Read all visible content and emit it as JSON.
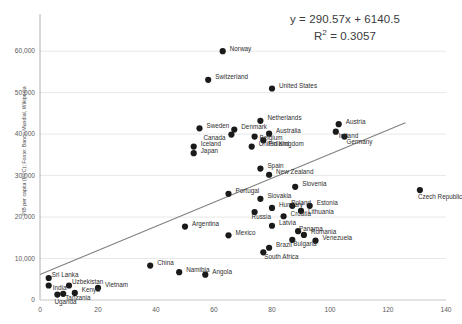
{
  "chart_data": {
    "type": "scatter",
    "title": "",
    "xlabel": "",
    "ylabel": "PIB per capita (PPC); Fonte: Banco Mundial, Wikipedia",
    "xlim": [
      0,
      140
    ],
    "ylim": [
      0,
      68000
    ],
    "xticks": [
      0,
      20,
      40,
      60,
      80,
      100,
      120,
      140
    ],
    "xtick_labels": [
      "0",
      "20",
      "40",
      "60",
      "80",
      "100",
      "120",
      "140"
    ],
    "yticks": [
      0,
      10000,
      20000,
      30000,
      40000,
      50000,
      60000
    ],
    "ytick_labels": [
      "0",
      "10,000",
      "20,000",
      "30,000",
      "40,000",
      "50,000",
      "60,000"
    ],
    "grid": "horizontal",
    "legend": "none",
    "marker_color": "#1a1a1a",
    "trendline_color": "#808080",
    "gridline_color": "#e8e8e8",
    "annotations": {
      "equation": "y = 290.57x + 6140.5",
      "r_squared_prefix": "R",
      "r_squared_sup": "2",
      "r_squared_value": " = 0.3057"
    },
    "trendline": {
      "slope": 290.57,
      "intercept": 6140.5,
      "x_start": 0,
      "x_end": 126
    },
    "points": [
      {
        "label": "Norway",
        "x": 63,
        "y": 60000,
        "lx": 7,
        "ly": -3
      },
      {
        "label": "Switzerland",
        "x": 58,
        "y": 53100,
        "lx": 7,
        "ly": -3
      },
      {
        "label": "United States",
        "x": 80,
        "y": 51000,
        "lx": 7,
        "ly": -3
      },
      {
        "label": "Netherlands",
        "x": 76,
        "y": 43200,
        "lx": 7,
        "ly": -3
      },
      {
        "label": "Austria",
        "x": 103,
        "y": 42400,
        "lx": 7,
        "ly": -3
      },
      {
        "label": "Sweden",
        "x": 55,
        "y": 41400,
        "lx": 7,
        "ly": -3
      },
      {
        "label": "Denmark",
        "x": 67,
        "y": 41100,
        "lx": 7,
        "ly": -3
      },
      {
        "label": "Ireland",
        "x": 102,
        "y": 40600,
        "lx": 3,
        "ly": 3.5
      },
      {
        "label": "Australia",
        "x": 79,
        "y": 40100,
        "lx": 7,
        "ly": -3
      },
      {
        "label": "Canada",
        "x": 66,
        "y": 39900,
        "lx": -28,
        "ly": 3
      },
      {
        "label": "Germany",
        "x": 105,
        "y": 39400,
        "lx": 2,
        "ly": 4.5
      },
      {
        "label": "Belgium",
        "x": 74,
        "y": 39400,
        "lx": 5,
        "ly": 1
      },
      {
        "label": "Finland",
        "x": 77,
        "y": 38500,
        "lx": 5,
        "ly": 3
      },
      {
        "label": "Iceland",
        "x": 53,
        "y": 37000,
        "lx": 7,
        "ly": -3
      },
      {
        "label": "United Kingdom",
        "x": 73,
        "y": 37000,
        "lx": 7,
        "ly": -3
      },
      {
        "label": "Japan",
        "x": 53,
        "y": 35400,
        "lx": 7,
        "ly": -3
      },
      {
        "label": "Spain",
        "x": 76,
        "y": 31700,
        "lx": 7,
        "ly": -3
      },
      {
        "label": "New Zealand",
        "x": 79,
        "y": 30200,
        "lx": 7,
        "ly": -3
      },
      {
        "label": "Czech Republic",
        "x": 131,
        "y": 26500,
        "lx": -2,
        "ly": 6
      },
      {
        "label": "Slovenia",
        "x": 88,
        "y": 27300,
        "lx": 7,
        "ly": -3
      },
      {
        "label": "Portugal",
        "x": 65,
        "y": 25600,
        "lx": 7,
        "ly": -3
      },
      {
        "label": "Slovakia",
        "x": 76,
        "y": 24400,
        "lx": 7,
        "ly": -3
      },
      {
        "label": "Poland",
        "x": 87,
        "y": 22700,
        "lx": -1,
        "ly": -3
      },
      {
        "label": "Estonia",
        "x": 93,
        "y": 22700,
        "lx": 7,
        "ly": -3
      },
      {
        "label": "Hungary",
        "x": 80,
        "y": 22200,
        "lx": 7,
        "ly": -3
      },
      {
        "label": "Russia",
        "x": 74,
        "y": 21200,
        "lx": -3,
        "ly": 4.5
      },
      {
        "label": "Lithuania",
        "x": 90,
        "y": 21500,
        "lx": 7,
        "ly": 1
      },
      {
        "label": "Croatia",
        "x": 84,
        "y": 20200,
        "lx": 7,
        "ly": -3
      },
      {
        "label": "Argentina",
        "x": 50,
        "y": 17700,
        "lx": 7,
        "ly": -3
      },
      {
        "label": "Latvia",
        "x": 80,
        "y": 17900,
        "lx": 7,
        "ly": -3
      },
      {
        "label": "Panama",
        "x": 89,
        "y": 16600,
        "lx": 1,
        "ly": -3
      },
      {
        "label": "Romania",
        "x": 91,
        "y": 15700,
        "lx": 7,
        "ly": -3
      },
      {
        "label": "Mexico",
        "x": 65,
        "y": 15600,
        "lx": 7,
        "ly": -3
      },
      {
        "label": "Bulgaria",
        "x": 87,
        "y": 14500,
        "lx": 1,
        "ly": 4
      },
      {
        "label": "Venezuela",
        "x": 95,
        "y": 14300,
        "lx": 7,
        "ly": -3
      },
      {
        "label": "Brazil",
        "x": 79,
        "y": 12600,
        "lx": 7,
        "ly": -3
      },
      {
        "label": "South Africa",
        "x": 77,
        "y": 11500,
        "lx": 1,
        "ly": 4
      },
      {
        "label": "China",
        "x": 38,
        "y": 8300,
        "lx": 7,
        "ly": -3
      },
      {
        "label": "Namibia",
        "x": 48,
        "y": 6700,
        "lx": 7,
        "ly": -3
      },
      {
        "label": "Angola",
        "x": 57,
        "y": 6100,
        "lx": 7,
        "ly": -3
      },
      {
        "label": "Sri Lanka",
        "x": 3,
        "y": 5300,
        "lx": 3,
        "ly": -3.5
      },
      {
        "label": "India",
        "x": 3,
        "y": 3500,
        "lx": 4,
        "ly": 2.5
      },
      {
        "label": "Uzbekistan",
        "x": 10,
        "y": 3500,
        "lx": 3,
        "ly": -3.5
      },
      {
        "label": "Vietnam",
        "x": 20,
        "y": 2900,
        "lx": 7,
        "ly": -3
      },
      {
        "label": "Kenya",
        "x": 12,
        "y": 1700,
        "lx": 7,
        "ly": -3
      },
      {
        "label": "Tanzania",
        "x": 8,
        "y": 1500,
        "lx": 2,
        "ly": 4
      },
      {
        "label": "Uganda",
        "x": 6,
        "y": 1300,
        "lx": -3,
        "ly": 6.5
      }
    ]
  }
}
